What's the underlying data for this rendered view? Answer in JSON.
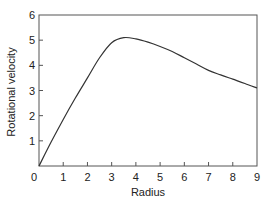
{
  "chart_data": {
    "type": "line",
    "title": "",
    "xlabel": "Radius",
    "ylabel": "Rotational velocity",
    "xlim": [
      0,
      9
    ],
    "ylim": [
      0,
      6
    ],
    "x_ticks": [
      "0",
      "1",
      "2",
      "3",
      "4",
      "5",
      "6",
      "7",
      "8",
      "9"
    ],
    "y_ticks": [
      "1",
      "2",
      "3",
      "4",
      "5",
      "6"
    ],
    "grid": false,
    "legend": null,
    "series": [
      {
        "name": "rotation curve",
        "x": [
          0,
          0.5,
          1,
          1.5,
          2,
          2.5,
          3,
          3.5,
          4,
          4.5,
          5,
          5.5,
          6,
          6.5,
          7,
          7.5,
          8,
          8.5,
          9
        ],
        "y": [
          0,
          0.95,
          1.85,
          2.7,
          3.5,
          4.3,
          4.9,
          5.1,
          5.05,
          4.92,
          4.75,
          4.55,
          4.3,
          4.05,
          3.8,
          3.62,
          3.45,
          3.28,
          3.1
        ]
      }
    ],
    "colors": {
      "line": "#333333",
      "axes": "#555555"
    }
  }
}
